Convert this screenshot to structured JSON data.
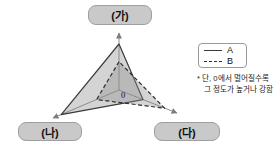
{
  "chart_data": {
    "type": "radar",
    "axes": [
      "(가)",
      "(나)",
      "(다)"
    ],
    "axis_positions": [
      "top",
      "bottom-left",
      "bottom-right"
    ],
    "origin_label": "0",
    "scale_note": "no numeric ticks; distance from 0 indicates degree",
    "series": [
      {
        "name": "A",
        "line_style": "solid",
        "values": [
          0.78,
          0.85,
          0.4
        ]
      },
      {
        "name": "B",
        "line_style": "dashed",
        "values": [
          0.48,
          0.33,
          0.76
        ]
      }
    ]
  },
  "legend": {
    "items": [
      {
        "label": "A",
        "line_style": "solid"
      },
      {
        "label": "B",
        "line_style": "dashed"
      }
    ]
  },
  "note": {
    "line1": "* 단, 0에서 멀어질수록",
    "line2": "그 정도가 높거나 강함"
  },
  "colors": {
    "node_box_fill": "#c9c9c9",
    "node_box_border": "#9f9f9f",
    "axis_line": "#8c8c8c",
    "polygon_fill": "#8f8f8f",
    "series_a_stroke": "#3c3c3c",
    "series_b_stroke": "#2e2e2e",
    "legend_border": "#999999"
  }
}
